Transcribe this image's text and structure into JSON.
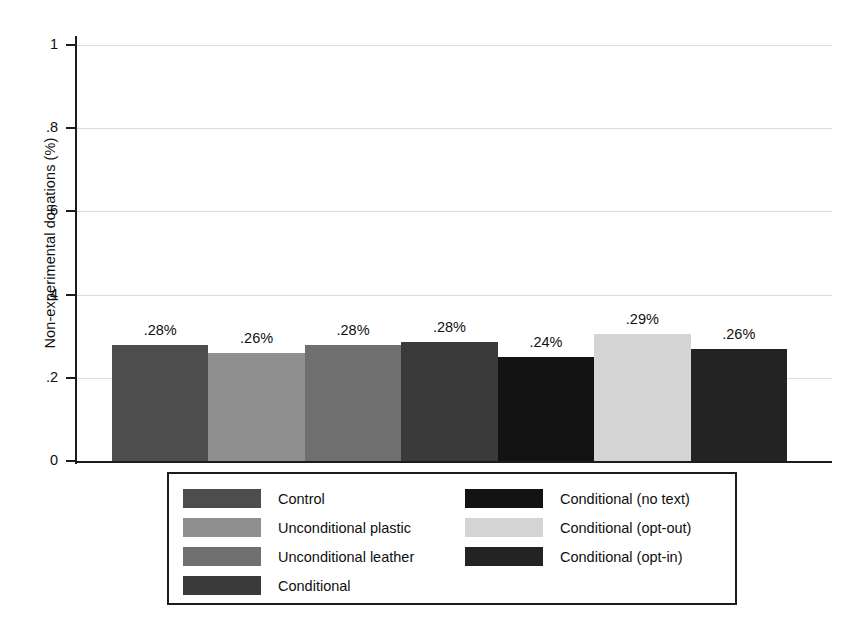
{
  "chart_data": {
    "type": "bar",
    "title": "",
    "xlabel": "",
    "ylabel": "Non-experimental donations (%)",
    "ylim": [
      0,
      1.05
    ],
    "grid": true,
    "legend_position": "bottom",
    "ytick_labels": [
      "0",
      ".2",
      ".4",
      ".6",
      ".8",
      "1"
    ],
    "ytick_values": [
      0,
      0.2,
      0.4,
      0.6,
      0.8,
      1
    ],
    "categories": [
      "Control",
      "Unconditional plastic",
      "Unconditional leather",
      "Conditional",
      "Conditional (no text)",
      "Conditional (opt-out)",
      "Conditional (opt-in)"
    ],
    "values": [
      0.28,
      0.26,
      0.28,
      0.285,
      0.25,
      0.305,
      0.27
    ],
    "data_labels": [
      ".28%",
      ".26%",
      ".28%",
      ".28%",
      ".24%",
      ".29%",
      ".26%"
    ],
    "colors": [
      "#4d4d4d",
      "#8f8f8f",
      "#6f6f6f",
      "#3a3a3a",
      "#131313",
      "#d4d4d4",
      "#232323"
    ]
  },
  "legend": {
    "left_column": [
      {
        "label": "Control",
        "color": "#4d4d4d"
      },
      {
        "label": "Unconditional plastic",
        "color": "#8f8f8f"
      },
      {
        "label": "Unconditional leather",
        "color": "#6f6f6f"
      },
      {
        "label": "Conditional",
        "color": "#3a3a3a"
      }
    ],
    "right_column": [
      {
        "label": "Conditional (no text)",
        "color": "#131313"
      },
      {
        "label": "Conditional (opt-out)",
        "color": "#d4d4d4"
      },
      {
        "label": "Conditional (opt-in)",
        "color": "#232323"
      }
    ]
  }
}
